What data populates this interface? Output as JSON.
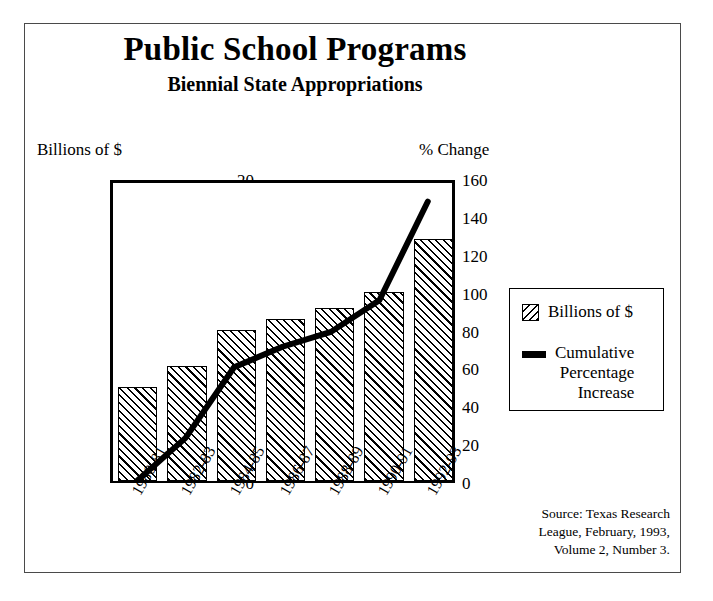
{
  "title": "Public School Programs",
  "subtitle": "Biennial State Appropriations",
  "axis_title_left": "Billions of $",
  "axis_title_right": "% Change",
  "legend": {
    "bars_label": "Billions of $",
    "line_label_line1": "Cumulative",
    "line_label_line2": "Percentage",
    "line_label_line3": "Increase"
  },
  "source_line1": "Source:  Texas Research",
  "source_line2": "League, February, 1993,",
  "source_line3": "Volume 2, Number 3.",
  "colors": {
    "ink": "#000000",
    "border": "#4a4a4a",
    "background": "#ffffff"
  },
  "chart_data": {
    "type": "bar",
    "title": "Public School Programs",
    "subtitle": "Biennial State Appropriations",
    "xlabel": "",
    "ylabel": "Billions of $",
    "y2label": "% Change",
    "categories": [
      "1980-81",
      "1982-83",
      "1984-85",
      "1986-87",
      "1988-89",
      "1990-91",
      "1992-93"
    ],
    "ylim": [
      0,
      20
    ],
    "yticks": [
      0,
      5,
      10,
      15,
      20
    ],
    "y2lim": [
      0,
      160
    ],
    "y2ticks": [
      0,
      20,
      40,
      60,
      80,
      100,
      120,
      140,
      160
    ],
    "grid": false,
    "legend_position": "right",
    "series": [
      {
        "name": "Billions of $",
        "type": "bar",
        "axis": "left",
        "values": [
          6.2,
          7.6,
          10.0,
          10.7,
          11.4,
          12.5,
          16.0
        ]
      },
      {
        "name": "Cumulative Percentage Increase",
        "type": "line",
        "axis": "right",
        "values": [
          0,
          23,
          61,
          72,
          80,
          97,
          150
        ]
      }
    ]
  }
}
